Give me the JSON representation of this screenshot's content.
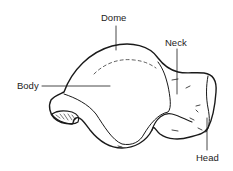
{
  "diagram": {
    "labels": {
      "dome": "Dome",
      "neck": "Neck",
      "body": "Body",
      "head": "Head"
    },
    "colors": {
      "line": "#1a1a1a",
      "background": "#ffffff"
    }
  }
}
